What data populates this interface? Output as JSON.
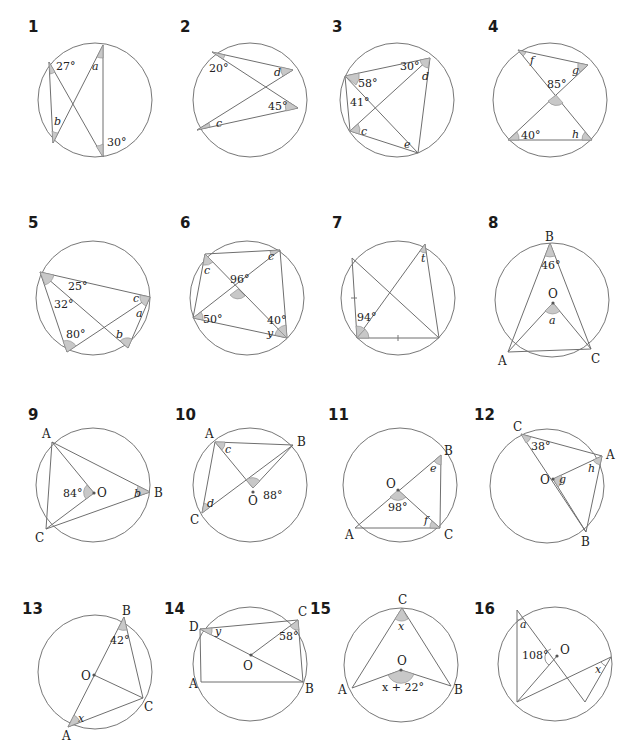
{
  "problems": [
    {
      "number": "1",
      "labels": {
        "given1": "27°",
        "given2": "30°",
        "var1": "a",
        "var2": "b"
      }
    },
    {
      "number": "2",
      "labels": {
        "given1": "20°",
        "given2": "45°",
        "var1": "d",
        "var2": "c"
      }
    },
    {
      "number": "3",
      "labels": {
        "given1": "58°",
        "given2": "30°",
        "given3": "41°",
        "var1": "d",
        "var2": "c",
        "var3": "e"
      }
    },
    {
      "number": "4",
      "labels": {
        "given1": "85°",
        "given2": "40°",
        "var1": "f",
        "var2": "g",
        "var3": "h"
      }
    },
    {
      "number": "5",
      "labels": {
        "given1": "25°",
        "given2": "32°",
        "given3": "80°",
        "var1": "c",
        "var2": "a",
        "var3": "b"
      }
    },
    {
      "number": "6",
      "labels": {
        "given1": "96°",
        "given2": "50°",
        "given3": "40°",
        "var1": "c",
        "var2": "c",
        "var3": "y"
      }
    },
    {
      "number": "7",
      "labels": {
        "given1": "94°",
        "var1": "t"
      }
    },
    {
      "number": "8",
      "labels": {
        "given1": "46°",
        "var1": "a",
        "pB": "B",
        "pO": "O",
        "pA": "A",
        "pC": "C"
      }
    },
    {
      "number": "9",
      "labels": {
        "given1": "84°",
        "var1": "b",
        "pA": "A",
        "pO": "O",
        "pB": "B",
        "pC": "C"
      }
    },
    {
      "number": "10",
      "labels": {
        "given1": "88°",
        "var1": "c",
        "var2": "d",
        "pA": "A",
        "pB": "B",
        "pC": "C",
        "pO": "O"
      }
    },
    {
      "number": "11",
      "labels": {
        "given1": "98°",
        "var1": "e",
        "var2": "f",
        "pO": "O",
        "pA": "A",
        "pB": "B",
        "pC": "C"
      }
    },
    {
      "number": "12",
      "labels": {
        "given1": "38°",
        "var1": "g",
        "var2": "h",
        "pC": "C",
        "pA": "A",
        "pO": "O",
        "pB": "B"
      }
    },
    {
      "number": "13",
      "labels": {
        "given1": "42°",
        "var1": "x",
        "pB": "B",
        "pO": "O",
        "pA": "A",
        "pC": "C"
      }
    },
    {
      "number": "14",
      "labels": {
        "given1": "58°",
        "var1": "y",
        "pD": "D",
        "pC": "C",
        "pO": "O",
        "pA": "A",
        "pB": "B"
      }
    },
    {
      "number": "15",
      "labels": {
        "given1": "x + 22°",
        "var1": "x",
        "pC": "C",
        "pO": "O",
        "pA": "A",
        "pB": "B"
      }
    },
    {
      "number": "16",
      "labels": {
        "given1": "108°",
        "var1": "a",
        "var2": "x",
        "pO": "O"
      }
    }
  ]
}
